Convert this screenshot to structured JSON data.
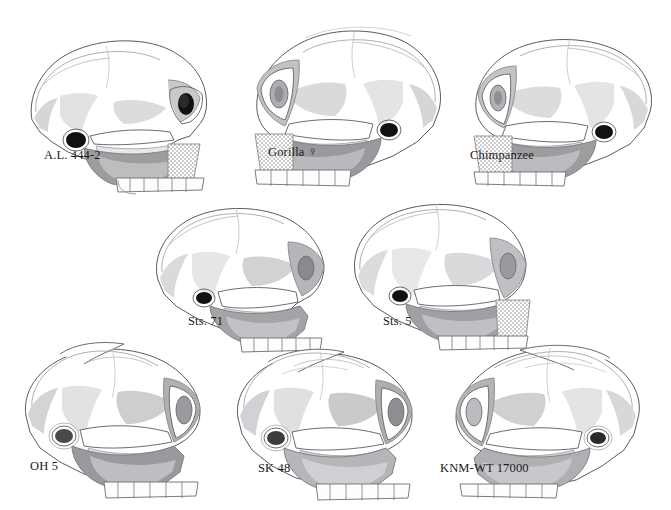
{
  "figure": {
    "header_text": "",
    "background_color": "#ffffff",
    "ink_color": "#1a1a1a",
    "caption_color": "#1a1a1a",
    "type": "comparative-anatomy-plate",
    "view": "lateral (left side) cranial outline drawings",
    "rows": 3,
    "specimen_count": 8
  },
  "palette": {
    "outline": "#4a4a4a",
    "outline_soft": "#8d8d8d",
    "bone_white": "#ffffff",
    "shade_light": "#e3e3e5",
    "shade_mid": "#c4c4c6",
    "shade_dark": "#9d9da0",
    "shade_darkest": "#7b7b7e",
    "orbit_black": "#111111",
    "stipple": "#a8a8ac",
    "tooth": "#fdfdfd"
  },
  "specimens": [
    {
      "id": "al-444-2",
      "label": "A.L. 444-2",
      "row": 1,
      "column": 1,
      "facing": "right",
      "has_stipple_zygomatic": true,
      "has_sagittal_crest": false,
      "caption_x": 44,
      "caption_y": 148
    },
    {
      "id": "gorilla-female",
      "label": "Gorilla",
      "label_symbol": "♀",
      "row": 1,
      "column": 2,
      "facing": "left",
      "has_stipple_zygomatic": true,
      "has_sagittal_crest": true,
      "caption_x": 268,
      "caption_y": 148
    },
    {
      "id": "chimpanzee",
      "label": "Chimpanzee",
      "row": 1,
      "column": 3,
      "facing": "left",
      "has_stipple_zygomatic": true,
      "has_sagittal_crest": false,
      "caption_x": 470,
      "caption_y": 148
    },
    {
      "id": "sts-71",
      "label": "Sts. 71",
      "row": 2,
      "column": 1,
      "facing": "right",
      "has_stipple_zygomatic": false,
      "has_sagittal_crest": false,
      "caption_x": 188,
      "caption_y": 314
    },
    {
      "id": "sts-5",
      "label": "Sts. 5",
      "row": 2,
      "column": 2,
      "facing": "right",
      "has_stipple_zygomatic": true,
      "has_sagittal_crest": false,
      "caption_x": 383,
      "caption_y": 314
    },
    {
      "id": "oh-5",
      "label": "OH 5",
      "row": 3,
      "column": 1,
      "facing": "right",
      "has_stipple_zygomatic": false,
      "has_sagittal_crest": true,
      "caption_x": 30,
      "caption_y": 459
    },
    {
      "id": "sk-48",
      "label": "SK 48",
      "row": 3,
      "column": 2,
      "facing": "right",
      "has_stipple_zygomatic": false,
      "has_sagittal_crest": true,
      "caption_x": 258,
      "caption_y": 459
    },
    {
      "id": "knm-wt-17000",
      "label": "KNM-WT 17000",
      "row": 3,
      "column": 3,
      "facing": "left",
      "has_stipple_zygomatic": false,
      "has_sagittal_crest": true,
      "caption_x": 440,
      "caption_y": 459
    }
  ]
}
